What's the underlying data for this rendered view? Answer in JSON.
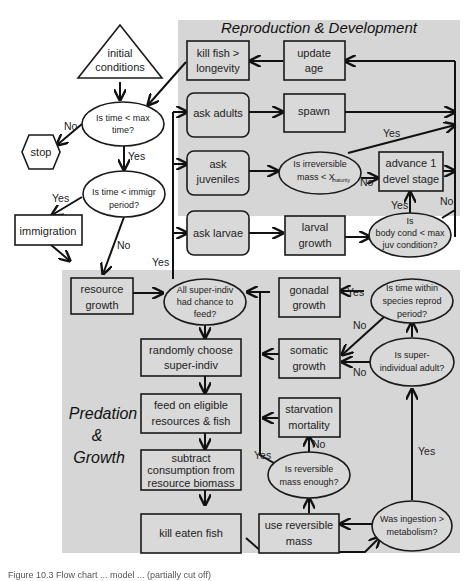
{
  "diagram": {
    "regions": {
      "reproduction": {
        "title": "Reproduction & Development",
        "color": "#d6d6d6"
      },
      "predation": {
        "title_lines": [
          "Predation",
          "&",
          "Growth"
        ],
        "color": "#d6d6d6"
      }
    },
    "nodes": {
      "initial_conditions": [
        "initial",
        "conditions"
      ],
      "time_lt_max": [
        "Is time < max",
        "time?"
      ],
      "stop": "stop",
      "time_lt_immigr": [
        "Is time < immigr",
        "period?"
      ],
      "immigration": "immigration",
      "resource_growth": [
        "resource",
        "growth"
      ],
      "kill_fish_longevity": [
        "kill fish >",
        "longevity"
      ],
      "update_age": [
        "update",
        "age"
      ],
      "ask_adults": "ask adults",
      "spawn": "spawn",
      "ask_juveniles": [
        "ask",
        "juveniles"
      ],
      "irreversible_mass": [
        "Is irreversible",
        "mass < X"
      ],
      "irreversible_mass_sub": "maturity",
      "advance_stage": [
        "advance 1",
        "devel stage"
      ],
      "ask_larvae": "ask larvae",
      "larval_growth": [
        "larval",
        "growth"
      ],
      "body_cond": [
        "Is",
        "body cond < max",
        "juv condition?"
      ],
      "all_fed": [
        "All super-indiv",
        "had chance to",
        "feed?"
      ],
      "gonadal_growth": [
        "gonadal",
        "growth"
      ],
      "within_reprod": [
        "Is time within",
        "species reprod",
        "period?"
      ],
      "randomly_choose": [
        "randomly choose",
        "super-indiv"
      ],
      "somatic_growth": [
        "somatic",
        "growth"
      ],
      "super_adult": [
        "Is super-",
        "individual adult?"
      ],
      "feed_on": [
        "feed on eligible",
        "resources & fish"
      ],
      "starvation": [
        "starvation",
        "mortality"
      ],
      "subtract": [
        "subtract",
        "consumption from",
        "resource biomass"
      ],
      "reversible_enough": [
        "Is reversible",
        "mass enough?"
      ],
      "kill_eaten": "kill eaten fish",
      "use_reversible": [
        "use reversible",
        "mass"
      ],
      "ingestion": [
        "Was ingestion >",
        "metabolism?"
      ]
    },
    "edge_labels": {
      "no_stop": "No",
      "yes_time": "Yes",
      "yes_immigr": "Yes",
      "no_immigr": "No",
      "yes_all_fed": "Yes",
      "yes_spawn": "Yes",
      "no_irrev": "No",
      "yes_body": "Yes",
      "no_body": "No",
      "yes_reprod": "Yes",
      "no_reprod": "No",
      "no_adult": "No",
      "yes_reversible": "Yes",
      "no_reversible": "No",
      "yes_ingestion": "Yes"
    }
  },
  "caption": "Figure 10.3  Flow chart ... model ... (partially cut off)"
}
